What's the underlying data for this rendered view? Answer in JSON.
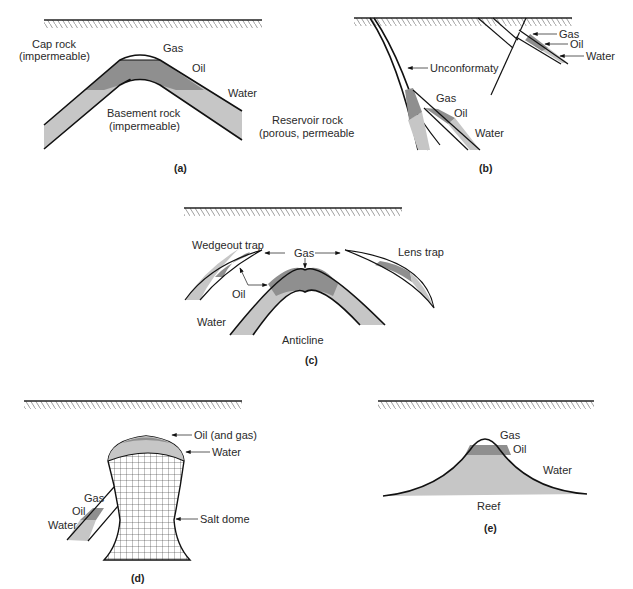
{
  "colors": {
    "oil": "#8f8f8f",
    "water": "#c6c6c6",
    "gas": "#ffffff",
    "line": "#111111"
  },
  "panels": {
    "a": {
      "caption": "(a)",
      "labels": {
        "cap_rock_1": "Cap rock",
        "cap_rock_2": "(impermeable)",
        "gas": "Gas",
        "oil": "Oil",
        "water": "Water",
        "basement_1": "Basement rock",
        "basement_2": "(impermeable)",
        "reservoir_1": "Reservoir rock",
        "reservoir_2": "(porous, permeable"
      }
    },
    "b": {
      "caption": "(b)",
      "labels": {
        "gas_top": "Gas",
        "oil_top": "Oil",
        "water_top": "Water",
        "unconformity": "Unconformaty",
        "gas": "Gas",
        "oil": "Oil",
        "water": "Water"
      }
    },
    "c": {
      "caption": "(c)",
      "labels": {
        "wedgeout": "Wedgeout trap",
        "gas": "Gas",
        "lens": "Lens trap",
        "oil": "Oil",
        "water": "Water",
        "anticline": "Anticline"
      }
    },
    "d": {
      "caption": "(d)",
      "labels": {
        "oil_gas": "Oil (and gas)",
        "water_top": "Water",
        "gas": "Gas",
        "oil": "Oil",
        "water": "Water",
        "salt_dome": "Salt dome"
      }
    },
    "e": {
      "caption": "(e)",
      "labels": {
        "gas": "Gas",
        "oil": "Oil",
        "water": "Water",
        "reef": "Reef"
      }
    }
  }
}
